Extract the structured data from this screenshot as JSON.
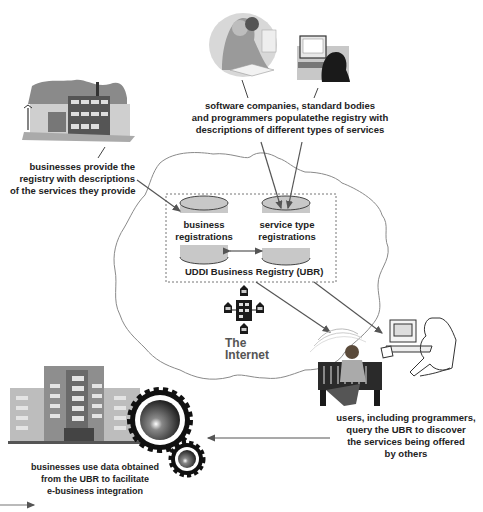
{
  "diagram": {
    "registry": {
      "title": "UDDI Business Registry (UBR)",
      "databases": [
        {
          "id": "business",
          "line1": "business",
          "line2": "registrations"
        },
        {
          "id": "service",
          "line1": "service type",
          "line2": "registrations"
        }
      ]
    },
    "cloud": {
      "label_line1": "The",
      "label_line2": "Internet"
    },
    "actors": {
      "software_companies": {
        "line1": "software companies, standard bodies",
        "line2": "and programmers populatethe registry with",
        "line3": "descriptions of different types of services"
      },
      "businesses_provide": {
        "line1": "businesses provide the",
        "line2": "registry with descriptions",
        "line3": "of the services they provide"
      },
      "users_query": {
        "line1": "users, including programmers,",
        "line2": "query the UBR to discover",
        "line3": "the services being offered",
        "line4": "by others"
      },
      "businesses_use": {
        "line1": "businesses use data obtained",
        "line2": "from the UBR to facilitate",
        "line3": "e-business integration"
      }
    },
    "colors": {
      "line": "#555555",
      "db_fill": "#c8c8c8",
      "db_stroke": "#444444",
      "cloud_stroke": "#888888",
      "dotted_border": "#777777"
    }
  }
}
